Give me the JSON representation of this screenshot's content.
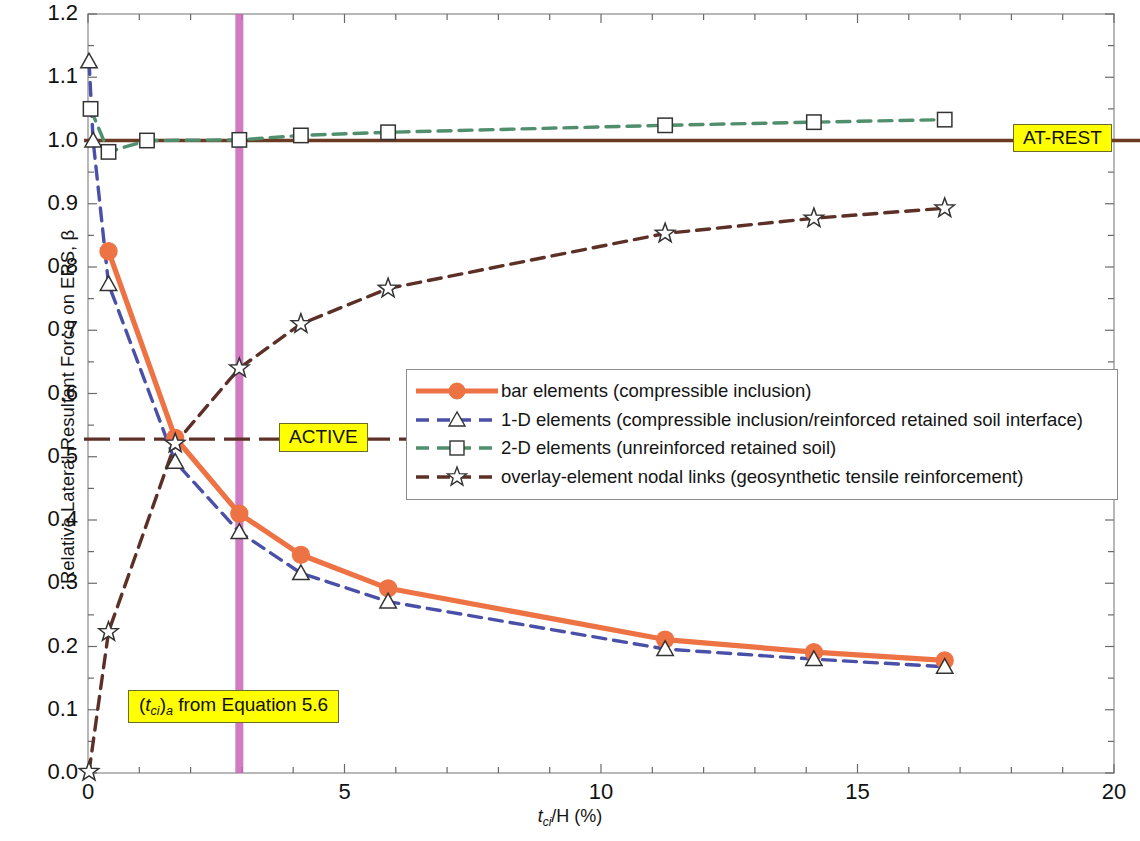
{
  "chart_data": {
    "type": "line",
    "title": "",
    "xlabel": "t_ci/H (%)",
    "ylabel": "Relative Lateral Resultant Force on ERS, β",
    "xlim": [
      0,
      20
    ],
    "ylim": [
      0.0,
      1.2
    ],
    "xticks": [
      0,
      5,
      10,
      15,
      20
    ],
    "yticks": [
      0.0,
      0.1,
      0.2,
      0.3,
      0.4,
      0.5,
      0.6,
      0.7,
      0.8,
      0.9,
      1.0,
      1.1,
      1.2
    ],
    "grid": false,
    "legend_position": "center-right",
    "series": [
      {
        "name": "bar elements (compressible inclusion)",
        "color": "#ee7344",
        "style": "solid",
        "marker": "circle",
        "points": [
          [
            0.4,
            0.825
          ],
          [
            1.7,
            0.53
          ],
          [
            2.95,
            0.41
          ],
          [
            4.15,
            0.345
          ],
          [
            5.85,
            0.292
          ],
          [
            11.25,
            0.211
          ],
          [
            14.15,
            0.191
          ],
          [
            16.7,
            0.178
          ]
        ]
      },
      {
        "name": "1-D elements (compressible inclusion/reinforced retained soil interface)",
        "color": "#4a4fa8",
        "style": "dashed",
        "marker": "triangle",
        "points": [
          [
            0.02,
            1.125
          ],
          [
            0.1,
            1.0
          ],
          [
            0.4,
            0.773
          ],
          [
            1.7,
            0.492
          ],
          [
            2.95,
            0.381
          ],
          [
            4.15,
            0.316
          ],
          [
            5.85,
            0.271
          ],
          [
            11.25,
            0.196
          ],
          [
            14.15,
            0.18
          ],
          [
            16.7,
            0.168
          ]
        ]
      },
      {
        "name": "2-D elements (unreinforced retained soil)",
        "color": "#4f8f6d",
        "style": "dashed",
        "marker": "square",
        "points": [
          [
            0.05,
            1.05
          ],
          [
            0.4,
            0.982
          ],
          [
            1.15,
            1.0
          ],
          [
            2.95,
            1.001
          ],
          [
            4.15,
            1.008
          ],
          [
            5.85,
            1.013
          ],
          [
            11.25,
            1.024
          ],
          [
            14.15,
            1.029
          ],
          [
            16.7,
            1.033
          ]
        ]
      },
      {
        "name": "overlay-element nodal links (geosynthetic tensile reinforcement)",
        "color": "#5c3026",
        "style": "dashed",
        "marker": "star",
        "points": [
          [
            0.02,
            0.002
          ],
          [
            0.4,
            0.223
          ],
          [
            1.7,
            0.521
          ],
          [
            2.95,
            0.64
          ],
          [
            4.15,
            0.71
          ],
          [
            5.85,
            0.766
          ],
          [
            11.25,
            0.853
          ],
          [
            14.15,
            0.877
          ],
          [
            16.7,
            0.893
          ]
        ]
      }
    ],
    "reference_lines": [
      {
        "name": "AT-REST",
        "orientation": "horizontal",
        "value": 1.0,
        "color": "#6b3a22",
        "style": "solid"
      },
      {
        "name": "ACTIVE",
        "orientation": "horizontal",
        "value": 0.528,
        "color": "#5c3026",
        "style": "dash-dot"
      },
      {
        "name": "(t_ci)_a from Equation 5.6",
        "orientation": "vertical",
        "value": 2.95,
        "color": "#c964b8",
        "style": "solid"
      }
    ]
  },
  "axes": {
    "y_tick_labels": [
      "1.2",
      "1.1",
      "1.0",
      "0.9",
      "0.8",
      "0.7",
      "0.6",
      "0.5",
      "0.4",
      "0.3",
      "0.2",
      "0.1",
      "0.0"
    ],
    "x_tick_labels": [
      "0",
      "5",
      "10",
      "15",
      "20"
    ],
    "y_axis_title": "Relative Lateral Resultant Force on ERS, β",
    "x_axis_title_main": "/H (%)",
    "x_axis_title_var": "t",
    "x_axis_title_sub": "ci"
  },
  "annotations": {
    "at_rest": {
      "label": "AT-REST"
    },
    "active": {
      "label": "ACTIVE"
    },
    "equation": {
      "prefix": "(",
      "var": "t",
      "sub": "ci",
      "mid": ")",
      "sub2": "a",
      "suffix": " from Equation 5.6",
      "full": "(t_ci)_a from Equation 5.6"
    }
  },
  "legend": {
    "items": [
      {
        "label": "bar elements (compressible inclusion)",
        "color": "#ee7344",
        "marker": "circle",
        "style": "solid"
      },
      {
        "label": "1-D elements (compressible inclusion/reinforced retained soil interface)",
        "color": "#4a4fa8",
        "marker": "triangle",
        "style": "dashed"
      },
      {
        "label": "2-D elements (unreinforced retained soil)",
        "color": "#4f8f6d",
        "marker": "square",
        "style": "dashed"
      },
      {
        "label": "overlay-element nodal links (geosynthetic tensile reinforcement)",
        "color": "#5c3026",
        "marker": "star",
        "style": "dashed"
      }
    ]
  },
  "colors": {
    "bar_elements": "#ee7344",
    "one_d_elements": "#4a4fa8",
    "two_d_elements": "#4f8f6d",
    "overlay_links": "#5c3026",
    "at_rest_line": "#6b3a22",
    "active_line": "#5c3026",
    "equation_line": "#c964b8",
    "highlight": "#ffff00",
    "axis": "#9a9a9a"
  }
}
